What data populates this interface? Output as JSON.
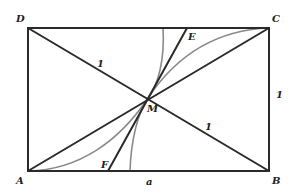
{
  "diagram": {
    "colors": {
      "line": "#2a2a2a",
      "arc": "#8a8a8a",
      "label": "#222222",
      "background": "#ffffff"
    },
    "points": {
      "A": {
        "label": "A",
        "x": 28,
        "y": 171
      },
      "B": {
        "label": "B",
        "x": 269,
        "y": 171
      },
      "C": {
        "label": "C",
        "x": 269,
        "y": 28
      },
      "D": {
        "label": "D",
        "x": 28,
        "y": 28
      },
      "M": {
        "label": "M",
        "x": 148,
        "y": 98
      },
      "E": {
        "label": "E",
        "x": 187,
        "y": 28
      },
      "F": {
        "label": "F",
        "x": 108,
        "y": 171
      }
    },
    "labels": {
      "A": "A",
      "B": "B",
      "C": "C",
      "D": "D",
      "M": "M",
      "E": "E",
      "F": "F",
      "side_bottom": "a",
      "side_right": "1",
      "half_diagonal_DM": "1",
      "half_diagonal_MB": "1"
    }
  }
}
